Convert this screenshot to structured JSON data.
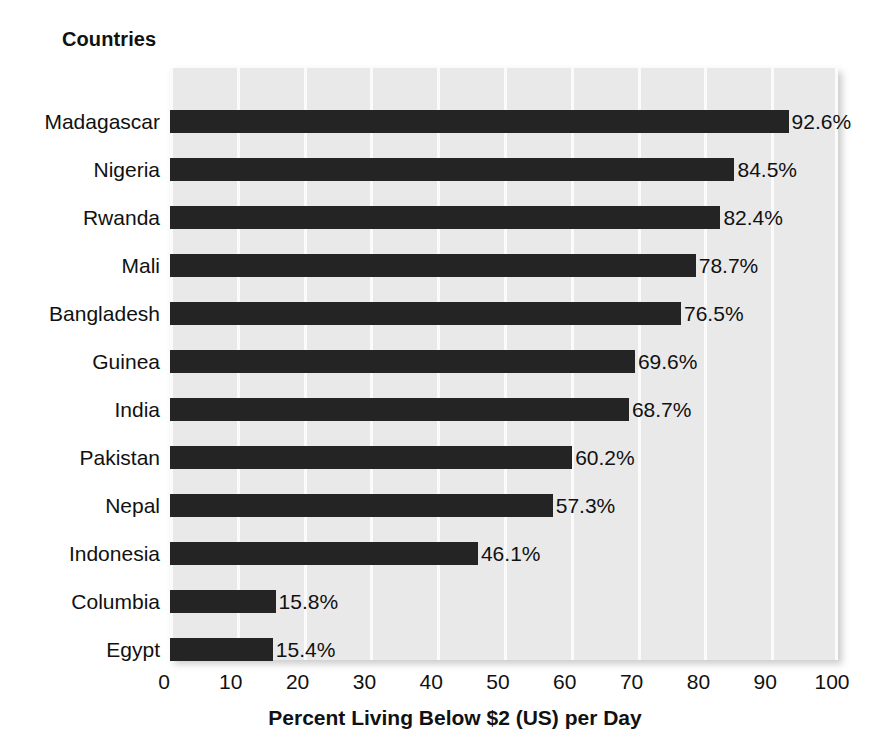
{
  "chart_data": {
    "type": "bar",
    "orientation": "horizontal",
    "title": "",
    "xlabel": "Percent Living Below $2 (US) per Day",
    "ylabel": "Countries",
    "categories": [
      "Madagascar",
      "Nigeria",
      "Rwanda",
      "Mali",
      "Bangladesh",
      "Guinea",
      "India",
      "Pakistan",
      "Nepal",
      "Indonesia",
      "Columbia",
      "Egypt"
    ],
    "values": [
      92.6,
      84.5,
      82.4,
      78.7,
      76.5,
      69.6,
      68.7,
      60.2,
      57.3,
      46.1,
      15.8,
      15.4
    ],
    "value_labels": [
      "92.6%",
      "84.5%",
      "82.4%",
      "78.7%",
      "76.5%",
      "69.6%",
      "68.7%",
      "60.2%",
      "57.3%",
      "46.1%",
      "15.8%",
      "15.4%"
    ],
    "xlim": [
      0,
      100
    ],
    "xticks": [
      0,
      10,
      20,
      30,
      40,
      50,
      60,
      70,
      80,
      90,
      100
    ],
    "xtick_labels": [
      "0",
      "10",
      "20",
      "30",
      "40",
      "50",
      "60",
      "70",
      "80",
      "90",
      "100"
    ],
    "grid": true,
    "grid_orientation": "vertical",
    "legend": false,
    "bar_color": "#242424",
    "plot_background_color": "#e9e9e9",
    "gridline_color": "#fbfbfb",
    "text_color": "#111111"
  }
}
